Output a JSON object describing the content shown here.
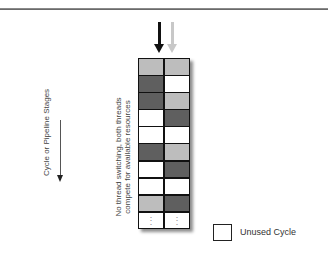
{
  "diagram": {
    "axis_label": "Cycle or Pipeline Stages",
    "note": "No thread switching, both threads compete for available resources",
    "threads": [
      {
        "name": "thread-1",
        "color": "#111111"
      },
      {
        "name": "thread-2",
        "color": "#c8c8c8"
      }
    ],
    "colors": {
      "light": "#bdbdbd",
      "dark": "#5f5f5f",
      "white": "#ffffff",
      "rule": "#777777"
    },
    "rows": [
      [
        "light",
        "light"
      ],
      [
        "dark",
        "white"
      ],
      [
        "dark",
        "light"
      ],
      [
        "white",
        "dark"
      ],
      [
        "white",
        "white"
      ],
      [
        "dark",
        "light"
      ],
      [
        "white",
        "dark"
      ],
      [
        "white",
        "white"
      ],
      [
        "light",
        "dark"
      ],
      [
        "dots",
        "dots"
      ]
    ],
    "legend": {
      "label": "Unused Cycle"
    }
  }
}
